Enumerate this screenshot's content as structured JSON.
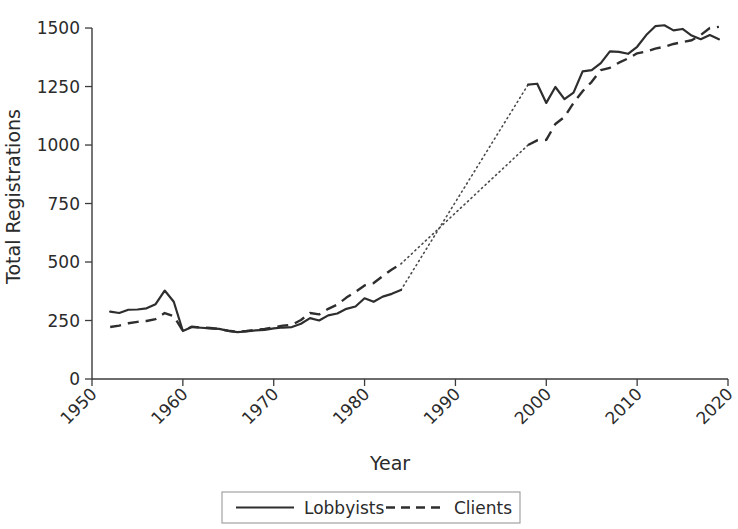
{
  "chart_data": {
    "type": "line",
    "title": "",
    "xlabel": "Year",
    "ylabel": "Total Registrations",
    "xlim": [
      1950,
      2020
    ],
    "ylim": [
      0,
      1560
    ],
    "xticks": [
      1950,
      1960,
      1970,
      1980,
      1990,
      2000,
      2010,
      2020
    ],
    "yticks": [
      0,
      250,
      500,
      750,
      1000,
      1250,
      1500
    ],
    "xtick_labels": [
      "1950",
      "1960",
      "1970",
      "1980",
      "1990",
      "2000",
      "2010",
      "2020"
    ],
    "ytick_labels": [
      "0",
      "250",
      "500",
      "750",
      "1000",
      "1250",
      "1500"
    ],
    "grid": false,
    "legend_position": "bottom-center",
    "gap_note": "dotted segments interpolate the 1984-1998 data gap",
    "series": [
      {
        "name": "Lobbyists",
        "style": "solid",
        "x": [
          1952,
          1953,
          1954,
          1955,
          1956,
          1957,
          1958,
          1959,
          1960,
          1961,
          1962,
          1963,
          1964,
          1965,
          1966,
          1967,
          1968,
          1969,
          1970,
          1971,
          1972,
          1973,
          1974,
          1975,
          1976,
          1977,
          1978,
          1979,
          1980,
          1981,
          1982,
          1983,
          1984
        ],
        "values": [
          288,
          282,
          296,
          297,
          302,
          320,
          378,
          330,
          205,
          222,
          219,
          216,
          214,
          206,
          200,
          203,
          208,
          210,
          216,
          220,
          222,
          236,
          260,
          250,
          272,
          280,
          300,
          310,
          345,
          330,
          352,
          364,
          380
        ]
      },
      {
        "name": "Lobbyists",
        "style": "solid",
        "segment": "recent",
        "x": [
          1998,
          1999,
          2000,
          2001,
          2002,
          2003,
          2004,
          2005,
          2006,
          2007,
          2008,
          2009,
          2010,
          2011,
          2012,
          2013,
          2014,
          2015,
          2016,
          2017,
          2018,
          2019
        ],
        "values": [
          1258,
          1262,
          1180,
          1248,
          1196,
          1224,
          1315,
          1320,
          1350,
          1400,
          1398,
          1390,
          1420,
          1470,
          1508,
          1512,
          1490,
          1496,
          1468,
          1452,
          1470,
          1452
        ]
      },
      {
        "name": "Clients",
        "style": "dashed",
        "x": [
          1952,
          1953,
          1954,
          1955,
          1956,
          1957,
          1958,
          1959,
          1960,
          1961,
          1962,
          1963,
          1964,
          1965,
          1966,
          1967,
          1968,
          1969,
          1970,
          1971,
          1972,
          1973,
          1974,
          1975,
          1976,
          1977,
          1978,
          1979,
          1980,
          1981,
          1982,
          1983,
          1984
        ],
        "values": [
          222,
          228,
          238,
          244,
          248,
          256,
          282,
          268,
          206,
          224,
          220,
          218,
          214,
          206,
          202,
          205,
          210,
          214,
          220,
          228,
          232,
          252,
          282,
          276,
          300,
          318,
          348,
          372,
          400,
          410,
          440,
          468,
          492
        ]
      },
      {
        "name": "Clients",
        "style": "dashed",
        "segment": "recent",
        "x": [
          1998,
          1999,
          2000,
          2001,
          2002,
          2003,
          2004,
          2005,
          2006,
          2007,
          2008,
          2009,
          2010,
          2011,
          2012,
          2013,
          2014,
          2015,
          2016,
          2017,
          2018,
          2019
        ],
        "values": [
          1000,
          1020,
          1022,
          1090,
          1120,
          1180,
          1230,
          1270,
          1320,
          1330,
          1352,
          1370,
          1392,
          1400,
          1412,
          1420,
          1432,
          1440,
          1448,
          1470,
          1500,
          1505
        ]
      }
    ],
    "gap_connectors": [
      {
        "series": "Lobbyists",
        "x": [
          1984,
          1998
        ],
        "values": [
          380,
          1258
        ]
      },
      {
        "series": "Clients",
        "x": [
          1984,
          1998
        ],
        "values": [
          492,
          1000
        ]
      }
    ],
    "legend": [
      {
        "label": "Lobbyists",
        "style": "solid"
      },
      {
        "label": "Clients",
        "style": "dashed"
      }
    ]
  }
}
